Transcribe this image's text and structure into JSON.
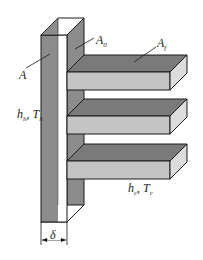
{
  "diagram": {
    "labels": {
      "wall_area": "A",
      "base_area": "A",
      "base_area_sub": "0",
      "fin_area": "A",
      "fin_area_sub": "f",
      "hot_h": "h",
      "hot_h_sub": "h",
      "hot_sep": ", ",
      "hot_T": "T",
      "hot_T_sub": "h",
      "cold_h": "h",
      "cold_h_sub": "c",
      "cold_sep": ", ",
      "cold_T": "T",
      "cold_T_sub": "c",
      "thickness": "δ"
    },
    "fins_count": 3,
    "colors": {
      "dark_face": "#8c8c8c",
      "top_face": "#7a7a7a",
      "front_face": "#c4c4c4",
      "side_face": "#dcdcdc",
      "white_strip": "#ffffff",
      "outline": "#1a1a1a"
    }
  }
}
